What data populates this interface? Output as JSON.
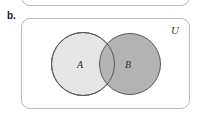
{
  "figure": {
    "part_label": "b.",
    "universe_label": "U",
    "caption": ""
  },
  "diagram": {
    "type": "venn",
    "shading": "union",
    "universe": {
      "name": "U",
      "x": 21,
      "y": 18,
      "width": 169,
      "height": 91,
      "corner_radius": 9,
      "border_color": "#b9b9b9",
      "fill_color": "#ffffff"
    },
    "previous_panel": {
      "visible_portion": "bottom-edge-only",
      "x": 21,
      "y": -26,
      "width": 169,
      "height": 32,
      "corner_radius": 9,
      "border_color": "#b9b9b9"
    },
    "sets": [
      {
        "label": "A",
        "cx": 83,
        "cy": 64,
        "r": 32,
        "fill_color": "#e6e6e6",
        "stroke_color": "#5a5a5a",
        "label_x": 81,
        "label_y": 64
      },
      {
        "label": "B",
        "cx": 130,
        "cy": 64,
        "r": 31,
        "fill_color": "#b3b3b3",
        "stroke_color": "#5a5a5a",
        "label_x": 129,
        "label_y": 64
      }
    ],
    "intersection": {
      "label": "",
      "fill_color": "#b3b3b3"
    }
  },
  "colors": {
    "page_background": "#ffffff",
    "rect_border": "#b9b9b9",
    "circle_stroke": "#5a5a5a",
    "set_a_fill": "#e6e6e6",
    "set_b_fill": "#b3b3b3",
    "text": "#1a1a1a"
  }
}
